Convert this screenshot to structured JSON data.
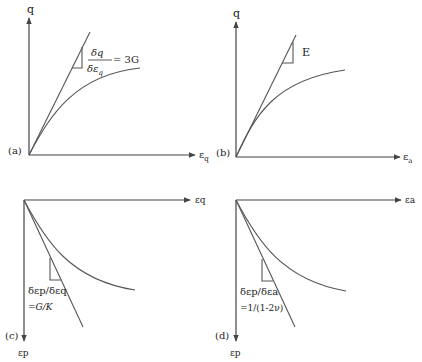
{
  "figure": {
    "panels": [
      {
        "id": "a",
        "tag": "(a)",
        "y_axis_label": "q",
        "x_axis_label": "ε",
        "x_axis_sub": "q",
        "slope_num": "δq",
        "slope_den": "δε",
        "slope_den_sub": "q",
        "slope_eq": "= 3G"
      },
      {
        "id": "b",
        "tag": "(b)",
        "y_axis_label": "q",
        "x_axis_label": "ε",
        "x_axis_sub": "a",
        "slope_label": "E"
      },
      {
        "id": "c",
        "tag": "(c)",
        "y_axis_label": "εp",
        "x_axis_label": "εq",
        "slope_label": "δεp/δεq",
        "slope_eq": "=G/K"
      },
      {
        "id": "d",
        "tag": "(d)",
        "y_axis_label": "εp",
        "x_axis_label": "εa",
        "slope_label": "δεp/δεa",
        "slope_eq": "=1/(1-2ν)"
      }
    ]
  }
}
